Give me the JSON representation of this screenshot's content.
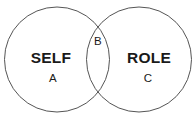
{
  "diagram": {
    "type": "venn-two-set",
    "background_color": "#ffffff",
    "stroke_color": "#555555",
    "text_color": "#1a1a1a",
    "sets": [
      {
        "id": "left",
        "label": "SELF",
        "region_label": "A",
        "cx": 57,
        "cy": 59.5,
        "r": 52.5
      },
      {
        "id": "right",
        "label": "ROLE",
        "region_label": "C",
        "cx": 139,
        "cy": 59.5,
        "r": 52.5
      }
    ],
    "intersection": {
      "region_label": "B"
    }
  }
}
